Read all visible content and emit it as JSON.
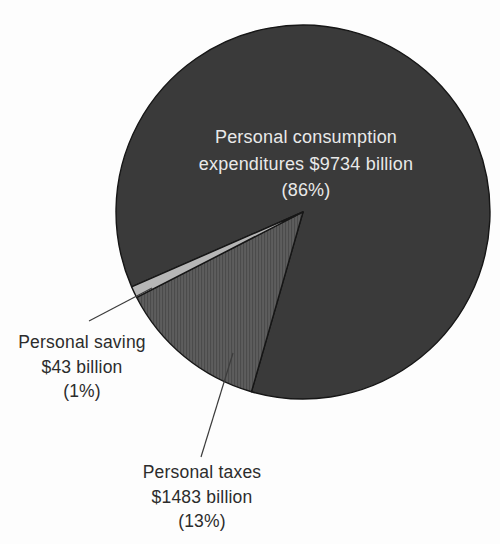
{
  "chart_data": {
    "type": "pie",
    "title": "",
    "legend": "none",
    "outline_color": "#161616",
    "leader_line_color": "#3c3c3c",
    "slices": [
      {
        "id": "consumption",
        "label": "Personal consumption expenditures",
        "label_lines": [
          "Personal consumption",
          "expenditures $9734 billion",
          "(86%)"
        ],
        "value_billions": 9734,
        "pct": 86,
        "color": "#3a3a3a",
        "text_color": "#e9e9e9",
        "label_position": "inside"
      },
      {
        "id": "saving",
        "label": "Personal saving",
        "label_lines": [
          "Personal saving",
          "$43 billion",
          "(1%)"
        ],
        "value_billions": 43,
        "pct": 1,
        "color": "#b6b6b6",
        "text_color": "#2c2c2c",
        "label_position": "outside-left"
      },
      {
        "id": "taxes",
        "label": "Personal taxes",
        "label_lines": [
          "Personal taxes",
          "$1483 billion",
          "(13%)"
        ],
        "value_billions": 1483,
        "pct": 13,
        "color": "#5d5d5d",
        "stripe_color": "#4b4b4b",
        "texture": "vertical-stripes",
        "text_color": "#2c2c2c",
        "label_position": "outside-bottom"
      }
    ]
  }
}
